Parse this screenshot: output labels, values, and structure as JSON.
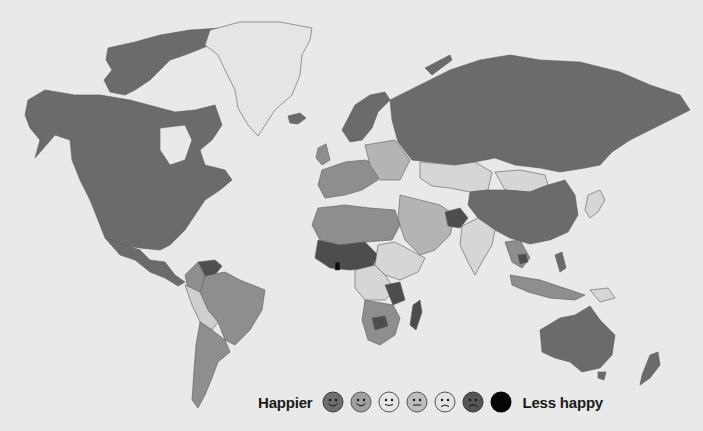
{
  "map": {
    "title": "",
    "type": "choropleth",
    "projection": "world",
    "colors": {
      "background": "#e9e9e9",
      "level_1": "#6b6b6b",
      "level_2": "#8e8e8e",
      "level_3": "#d6d6d6",
      "level_4": "#b4b4b4",
      "level_5": "#cfcfcf",
      "level_6": "#4d4d4d",
      "level_7": "#0a0a0a",
      "no_data": "#ececec",
      "border": "#5a5a5a"
    },
    "regions": [
      {
        "name": "North America",
        "level": 1
      },
      {
        "name": "Greenland",
        "level": "no_data"
      },
      {
        "name": "Iceland",
        "level": 1
      },
      {
        "name": "Russia",
        "level": 1
      },
      {
        "name": "China",
        "level": 1
      },
      {
        "name": "Mongolia",
        "level": 3
      },
      {
        "name": "Kazakhstan",
        "level": 3
      },
      {
        "name": "India",
        "level": 3
      },
      {
        "name": "Australia",
        "level": 1
      },
      {
        "name": "New Zealand",
        "level": 1
      },
      {
        "name": "Brazil",
        "level": 2
      },
      {
        "name": "Argentina",
        "level": 2
      },
      {
        "name": "Venezuela",
        "level": 1
      },
      {
        "name": "Scandinavia",
        "level": 1
      },
      {
        "name": "Western Europe",
        "level": 2
      },
      {
        "name": "North Africa",
        "level": 2
      },
      {
        "name": "West Africa",
        "level": 6
      },
      {
        "name": "Central Africa",
        "level": 3
      },
      {
        "name": "Southern Africa",
        "level": 2
      },
      {
        "name": "Madagascar",
        "level": 6
      },
      {
        "name": "Afghanistan",
        "level": 6
      },
      {
        "name": "Middle East",
        "level": 2
      }
    ]
  },
  "legend": {
    "left_label": "Happier",
    "right_label": "Less happy",
    "items": [
      {
        "icon": "smile-face-icon",
        "fill": "#6e6e6e",
        "mood": "smile"
      },
      {
        "icon": "smile-face-icon",
        "fill": "#a0a0a0",
        "mood": "smile"
      },
      {
        "icon": "slight-smile-face-icon",
        "fill": "#e6e6e6",
        "mood": "slight-smile"
      },
      {
        "icon": "neutral-face-icon",
        "fill": "#bdbdbd",
        "mood": "neutral"
      },
      {
        "icon": "frown-face-icon",
        "fill": "#e3e3e3",
        "mood": "frown"
      },
      {
        "icon": "frown-face-icon",
        "fill": "#555555",
        "mood": "frown"
      },
      {
        "icon": "blank-circle-icon",
        "fill": "#050505",
        "mood": "none"
      }
    ]
  }
}
